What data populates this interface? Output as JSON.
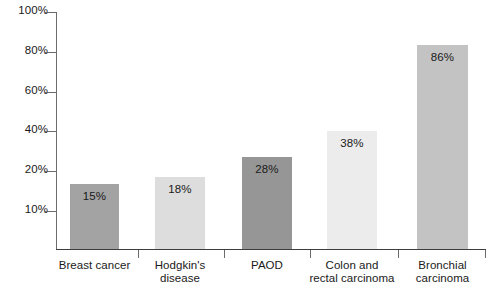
{
  "chart_data": {
    "type": "bar",
    "title": "",
    "subtitle": "",
    "xlabel": "",
    "ylabel": "",
    "categories": [
      "Breast cancer",
      "Hodgkin's disease",
      "PAOD",
      "Colon and rectal carcinoma",
      "Bronchial carcinoma"
    ],
    "values": [
      15,
      18,
      28,
      38,
      86
    ],
    "value_labels": [
      "15%",
      "18%",
      "28%",
      "38%",
      "86%"
    ],
    "ylim": [
      0,
      100
    ],
    "ytick_labels": [
      "100%",
      "80%",
      "60%",
      "40%",
      "20%",
      "10%"
    ],
    "ytick_values": [
      100,
      80,
      60,
      40,
      20,
      10
    ],
    "grid": false,
    "legend": "none",
    "bar_colors": [
      "#a3a3a3",
      "#dddddd",
      "#969696",
      "#ececec",
      "#c3c3c3"
    ],
    "axis_color": "#6b6b6b",
    "baseline_color": "#3d3d3d",
    "label_color": "#1a1a1a",
    "background": "#ffffff",
    "note": "Y-axis tick spacing is uniform in pixels though the bottom interval spans 20% to 10%."
  },
  "axis": {
    "y_ticks": [
      {
        "label": "100%",
        "y": 12
      },
      {
        "label": "80%",
        "y": 52
      },
      {
        "label": "60%",
        "y": 92
      },
      {
        "label": "40%",
        "y": 131
      },
      {
        "label": "20%",
        "y": 171
      },
      {
        "label": "10%",
        "y": 211
      }
    ]
  },
  "bars": [
    {
      "category_line1": "Breast cancer",
      "category_line2": "",
      "value_label": "15%",
      "color": "#a3a3a3",
      "left": 70,
      "width": 49,
      "height": 65
    },
    {
      "category_line1": "Hodgkin's",
      "category_line2": "disease",
      "value_label": "18%",
      "color": "#dddddd",
      "left": 155,
      "width": 50,
      "height": 72
    },
    {
      "category_line1": "PAOD",
      "category_line2": "",
      "value_label": "28%",
      "color": "#969696",
      "left": 242,
      "width": 50,
      "height": 92
    },
    {
      "category_line1": "Colon and",
      "category_line2": "rectal carcinoma",
      "value_label": "38%",
      "color": "#ececec",
      "left": 327,
      "width": 50,
      "height": 118
    },
    {
      "category_line1": "Bronchial",
      "category_line2": "carcinoma",
      "value_label": "86%",
      "color": "#c3c3c3",
      "left": 417,
      "width": 51,
      "height": 204
    }
  ],
  "separators": [
    {
      "x": 138
    },
    {
      "x": 224
    },
    {
      "x": 310
    },
    {
      "x": 398
    }
  ]
}
